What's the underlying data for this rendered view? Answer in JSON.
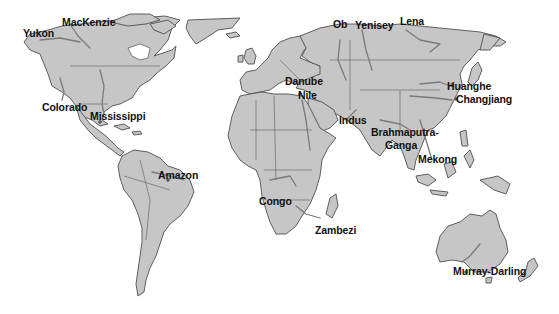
{
  "map": {
    "type": "world-map",
    "projection": "equirectangular-like",
    "colors": {
      "background": "#ffffff",
      "land": "#c6c6c6",
      "country_border": "#4f4f4f",
      "river": "#7a7a7a",
      "label_text": "#111111"
    },
    "rivers": [
      {
        "name": "Yukon",
        "x": 23,
        "y": 28
      },
      {
        "name": "MacKenzie",
        "x": 62,
        "y": 17
      },
      {
        "name": "Ob",
        "x": 333,
        "y": 19
      },
      {
        "name": "Yenisey",
        "x": 355,
        "y": 20
      },
      {
        "name": "Lena",
        "x": 400,
        "y": 16
      },
      {
        "name": "Colorado",
        "x": 42,
        "y": 102
      },
      {
        "name": "Mississippi",
        "x": 90,
        "y": 111
      },
      {
        "name": "Danube",
        "x": 285,
        "y": 76
      },
      {
        "name": "Nile",
        "x": 298,
        "y": 90
      },
      {
        "name": "Indus",
        "x": 339,
        "y": 115
      },
      {
        "name": "Huanghe",
        "x": 447,
        "y": 81
      },
      {
        "name": "Changjiang",
        "x": 456,
        "y": 94
      },
      {
        "name": "Brahmaputra-",
        "x": 371,
        "y": 127
      },
      {
        "name": "Ganga",
        "x": 385,
        "y": 140
      },
      {
        "name": "Mekong",
        "x": 418,
        "y": 154
      },
      {
        "name": "Amazon",
        "x": 158,
        "y": 170
      },
      {
        "name": "Congo",
        "x": 259,
        "y": 196
      },
      {
        "name": "Zambezi",
        "x": 315,
        "y": 225
      },
      {
        "name": "Murray-Darling",
        "x": 453,
        "y": 266
      }
    ]
  }
}
